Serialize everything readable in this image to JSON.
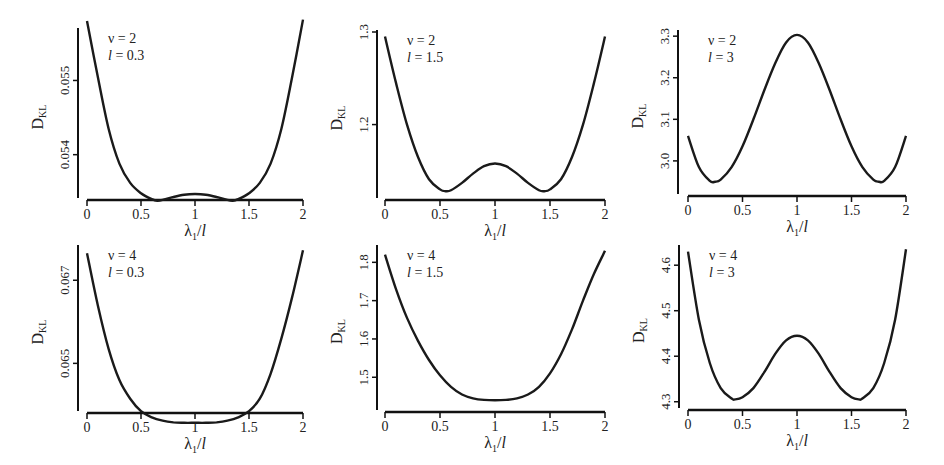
{
  "chart_data": [
    {
      "type": "line",
      "panel": "top-left",
      "annotation": [
        "ν = 2",
        "l = 0.3"
      ],
      "xlabel": "λ1/l",
      "ylabel": "DKL",
      "xticks": [
        0,
        0.5,
        1,
        1.5,
        2
      ],
      "xtick_labels": [
        "0",
        "0.5",
        "1",
        "1.5",
        "2"
      ],
      "yticks": [
        0.054,
        0.055
      ],
      "ytick_labels": [
        "0.054",
        "0.055"
      ],
      "xlim": [
        0,
        2
      ],
      "ylim": [
        0.05347,
        0.05568
      ],
      "x": [
        0,
        0.1,
        0.2,
        0.3,
        0.4,
        0.5,
        0.6,
        0.65,
        0.7,
        0.8,
        0.9,
        1.0,
        1.1,
        1.2,
        1.3,
        1.35,
        1.4,
        1.5,
        1.6,
        1.7,
        1.8,
        1.9,
        2.0
      ],
      "values": [
        0.0558,
        0.05505,
        0.05435,
        0.05388,
        0.05362,
        0.05348,
        0.0534,
        0.05338,
        0.05339,
        0.05343,
        0.05346,
        0.05347,
        0.05346,
        0.05343,
        0.05339,
        0.05338,
        0.0534,
        0.05348,
        0.05362,
        0.05388,
        0.05435,
        0.05505,
        0.05582
      ]
    },
    {
      "type": "line",
      "panel": "top-middle",
      "annotation": [
        "ν = 2",
        "l = 1.5"
      ],
      "xlabel": "λ1/l",
      "ylabel": "DKL",
      "xticks": [
        0,
        0.5,
        1,
        1.5,
        2
      ],
      "xtick_labels": [
        "0",
        "0.5",
        "1",
        "1.5",
        "2"
      ],
      "yticks": [
        1.2,
        1.3
      ],
      "ytick_labels": [
        "1.2",
        "1.3"
      ],
      "xlim": [
        0,
        2
      ],
      "ylim": [
        1.125,
        1.3
      ],
      "x": [
        0,
        0.1,
        0.2,
        0.3,
        0.4,
        0.5,
        0.55,
        0.6,
        0.7,
        0.8,
        0.9,
        1.0,
        1.1,
        1.2,
        1.3,
        1.4,
        1.45,
        1.5,
        1.6,
        1.7,
        1.8,
        1.9,
        2.0
      ],
      "values": [
        1.295,
        1.245,
        1.2,
        1.165,
        1.141,
        1.13,
        1.128,
        1.129,
        1.137,
        1.147,
        1.155,
        1.158,
        1.155,
        1.147,
        1.137,
        1.129,
        1.128,
        1.13,
        1.141,
        1.165,
        1.2,
        1.245,
        1.295
      ]
    },
    {
      "type": "line",
      "panel": "top-right",
      "annotation": [
        "ν = 2",
        "l = 3"
      ],
      "xlabel": "λ1/l",
      "ylabel": "DKL",
      "xticks": [
        0,
        0.5,
        1,
        1.5,
        2
      ],
      "xtick_labels": [
        "0",
        "0.5",
        "1",
        "1.5",
        "2"
      ],
      "yticks": [
        3.0,
        3.1,
        3.2,
        3.3
      ],
      "ytick_labels": [
        "3.0",
        "3.1",
        "3.2",
        "3.3"
      ],
      "xlim": [
        0,
        2
      ],
      "ylim": [
        2.93,
        3.31
      ],
      "x": [
        0,
        0.1,
        0.2,
        0.25,
        0.3,
        0.4,
        0.5,
        0.6,
        0.7,
        0.8,
        0.9,
        1.0,
        1.1,
        1.2,
        1.3,
        1.4,
        1.5,
        1.6,
        1.7,
        1.75,
        1.8,
        1.9,
        2.0
      ],
      "values": [
        3.06,
        2.985,
        2.952,
        2.95,
        2.955,
        2.985,
        3.035,
        3.1,
        3.17,
        3.235,
        3.285,
        3.303,
        3.285,
        3.235,
        3.17,
        3.1,
        3.035,
        2.985,
        2.955,
        2.95,
        2.952,
        2.985,
        3.06
      ]
    },
    {
      "type": "line",
      "panel": "bottom-left",
      "annotation": [
        "ν = 4",
        "l = 0.3"
      ],
      "xlabel": "λ1/l",
      "ylabel": "DKL",
      "xticks": [
        0,
        0.5,
        1,
        1.5,
        2
      ],
      "xtick_labels": [
        "0",
        "0.5",
        "1",
        "1.5",
        "2"
      ],
      "yticks": [
        0.065,
        0.067
      ],
      "ytick_labels": [
        "0.065",
        "0.067"
      ],
      "xlim": [
        0,
        2
      ],
      "ylim": [
        0.06395,
        0.0678
      ],
      "x": [
        0,
        0.1,
        0.2,
        0.3,
        0.4,
        0.5,
        0.6,
        0.7,
        0.8,
        0.9,
        1.0,
        1.1,
        1.2,
        1.3,
        1.4,
        1.5,
        1.6,
        1.7,
        1.8,
        1.9,
        2.0
      ],
      "values": [
        0.06765,
        0.0664,
        0.06535,
        0.0646,
        0.06415,
        0.06385,
        0.0637,
        0.06362,
        0.06358,
        0.06357,
        0.06357,
        0.06357,
        0.06358,
        0.06362,
        0.0637,
        0.06385,
        0.06415,
        0.06475,
        0.0656,
        0.0666,
        0.06772
      ]
    },
    {
      "type": "line",
      "panel": "bottom-middle",
      "annotation": [
        "ν = 4",
        "l = 1.5"
      ],
      "xlabel": "λ1/l",
      "ylabel": "DKL",
      "xticks": [
        0,
        0.5,
        1,
        1.5,
        2
      ],
      "xtick_labels": [
        "0",
        "0.5",
        "1",
        "1.5",
        "2"
      ],
      "yticks": [
        1.5,
        1.6,
        1.7,
        1.8
      ],
      "ytick_labels": [
        "1.5",
        "1.6",
        "1.7",
        "1.8"
      ],
      "xlim": [
        0,
        2
      ],
      "ylim": [
        1.425,
        1.84
      ],
      "x": [
        0,
        0.1,
        0.2,
        0.3,
        0.4,
        0.5,
        0.6,
        0.7,
        0.8,
        0.9,
        1.0,
        1.1,
        1.2,
        1.3,
        1.4,
        1.5,
        1.6,
        1.7,
        1.8,
        1.9,
        2.0
      ],
      "values": [
        1.82,
        1.73,
        1.655,
        1.595,
        1.545,
        1.505,
        1.475,
        1.455,
        1.445,
        1.441,
        1.44,
        1.441,
        1.445,
        1.455,
        1.475,
        1.51,
        1.56,
        1.625,
        1.7,
        1.77,
        1.83
      ]
    },
    {
      "type": "line",
      "panel": "bottom-right",
      "annotation": [
        "ν = 4",
        "l = 3"
      ],
      "xlabel": "λ1/l",
      "ylabel": "DKL",
      "xticks": [
        0,
        0.5,
        1,
        1.5,
        2
      ],
      "xtick_labels": [
        "0",
        "0.5",
        "1",
        "1.5",
        "2"
      ],
      "yticks": [
        4.3,
        4.4,
        4.5,
        4.6
      ],
      "ytick_labels": [
        "4.3",
        "4.4",
        "4.5",
        "4.6"
      ],
      "xlim": [
        0,
        2
      ],
      "ylim": [
        4.295,
        4.64
      ],
      "x": [
        0,
        0.1,
        0.2,
        0.3,
        0.4,
        0.43,
        0.5,
        0.6,
        0.7,
        0.8,
        0.9,
        1.0,
        1.1,
        1.2,
        1.3,
        1.4,
        1.5,
        1.57,
        1.6,
        1.7,
        1.8,
        1.9,
        2.0
      ],
      "values": [
        4.63,
        4.48,
        4.385,
        4.33,
        4.307,
        4.305,
        4.31,
        4.33,
        4.365,
        4.405,
        4.435,
        4.445,
        4.435,
        4.405,
        4.365,
        4.33,
        4.31,
        4.305,
        4.307,
        4.33,
        4.385,
        4.48,
        4.635
      ]
    }
  ],
  "panels_layout": [
    {
      "left": 78,
      "right": 303,
      "top": 28,
      "bottom": 198,
      "x0": 87
    },
    {
      "left": 377,
      "right": 605,
      "top": 30,
      "bottom": 198,
      "x0": 385
    },
    {
      "left": 678,
      "right": 906,
      "top": 30,
      "bottom": 194,
      "x0": 688
    },
    {
      "left": 78,
      "right": 303,
      "top": 245,
      "bottom": 411,
      "x0": 87
    },
    {
      "left": 377,
      "right": 605,
      "top": 245,
      "bottom": 410,
      "x0": 385
    },
    {
      "left": 679,
      "right": 906,
      "top": 245,
      "bottom": 408,
      "x0": 688
    }
  ],
  "style": {
    "line_color": "#1a1a1a",
    "axis_color": "#111111",
    "background": "#ffffff"
  }
}
